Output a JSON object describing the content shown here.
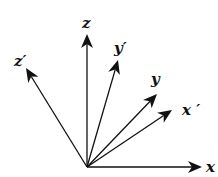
{
  "diagram": {
    "title": "",
    "type": "coordinate-axes-rotation",
    "origin": {
      "x": 87,
      "y": 167
    },
    "axes": [
      {
        "id": "x",
        "label": "x",
        "tip": {
          "x": 202,
          "y": 167
        },
        "label_pos": {
          "x": 206,
          "y": 172
        }
      },
      {
        "id": "x_prime",
        "label": "x ′",
        "tip": {
          "x": 172,
          "y": 110
        },
        "label_pos": {
          "x": 182,
          "y": 115
        }
      },
      {
        "id": "y",
        "label": "y",
        "tip": {
          "x": 157,
          "y": 94
        },
        "label_pos": {
          "x": 151,
          "y": 84
        }
      },
      {
        "id": "y_prime",
        "label": "y′",
        "tip": {
          "x": 118,
          "y": 60
        },
        "label_pos": {
          "x": 114,
          "y": 53
        }
      },
      {
        "id": "z",
        "label": "z",
        "tip": {
          "x": 87,
          "y": 34
        },
        "label_pos": {
          "x": 82,
          "y": 28
        }
      },
      {
        "id": "z_prime",
        "label": "z′",
        "tip": {
          "x": 26,
          "y": 68
        },
        "label_pos": {
          "x": 14,
          "y": 66
        }
      }
    ],
    "colors": {
      "stroke": "#111111",
      "background": "#ffffff"
    }
  }
}
